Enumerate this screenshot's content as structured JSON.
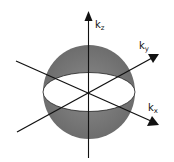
{
  "diagram": {
    "type": "3d-k-space-sphere",
    "axes": [
      {
        "id": "kz",
        "label": "k",
        "subscript": "z"
      },
      {
        "id": "ky",
        "label": "k",
        "subscript": "y"
      },
      {
        "id": "kx",
        "label": "k",
        "subscript": "x"
      }
    ],
    "colors": {
      "sphere_fill": "#7a7a7a",
      "ellipse_fill": "#ffffff",
      "axis_stroke": "#111111"
    }
  }
}
